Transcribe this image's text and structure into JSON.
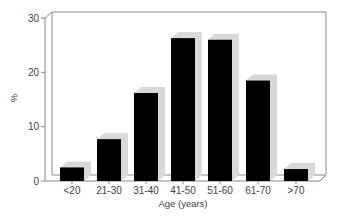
{
  "chart_data": {
    "type": "bar",
    "title": "",
    "xlabel": "Age (years)",
    "ylabel": "%",
    "ylim": [
      0,
      30
    ],
    "yticks": [
      0,
      10,
      20,
      30
    ],
    "grid": false,
    "style": "3d",
    "categories": [
      "<20",
      "21-30",
      "31-40",
      "41-50",
      "51-60",
      "61-70",
      ">70"
    ],
    "values": [
      2.5,
      7.7,
      16.2,
      26.3,
      26.0,
      18.5,
      2.2
    ],
    "bar_color": "#000000",
    "shadow_color": "#d9d9d9"
  }
}
